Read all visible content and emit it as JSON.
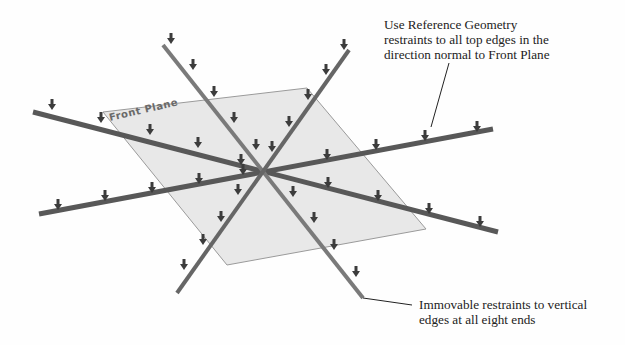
{
  "diagram": {
    "plane": {
      "label": "Front Plane",
      "corners": [
        [
          103,
          112
        ],
        [
          307,
          88
        ],
        [
          426,
          229
        ],
        [
          227,
          265
        ]
      ],
      "fill": "#e8e8e8",
      "stroke": "#9a9a9a"
    },
    "center": [
      263,
      172
    ],
    "beams": [
      {
        "name": "beam-shallow-descending",
        "from": [
          33,
          112
        ],
        "to": [
          498,
          232
        ],
        "color": "#585858",
        "width": 5
      },
      {
        "name": "beam-shallow-ascending",
        "from": [
          39,
          214
        ],
        "to": [
          493,
          129
        ],
        "color": "#585858",
        "width": 5
      },
      {
        "name": "beam-steep-descending",
        "from": [
          163,
          45
        ],
        "to": [
          363,
          298
        ],
        "color": "#7a7a7a",
        "width": 4
      },
      {
        "name": "beam-steep-ascending",
        "from": [
          349,
          50
        ],
        "to": [
          177,
          293
        ],
        "color": "#666666",
        "width": 4
      }
    ],
    "arrow_color": "#3c3c3c",
    "arrows": [
      [
        52,
        110
      ],
      [
        101,
        123
      ],
      [
        150,
        135
      ],
      [
        198,
        148
      ],
      [
        241,
        165
      ],
      [
        328,
        188
      ],
      [
        378,
        201
      ],
      [
        429,
        214
      ],
      [
        480,
        227
      ],
      [
        58,
        210
      ],
      [
        105,
        201
      ],
      [
        152,
        193
      ],
      [
        199,
        184
      ],
      [
        243,
        175
      ],
      [
        327,
        160
      ],
      [
        376,
        150
      ],
      [
        425,
        141
      ],
      [
        477,
        132
      ],
      [
        171,
        44
      ],
      [
        193,
        70
      ],
      [
        214,
        97
      ],
      [
        234,
        123
      ],
      [
        256,
        150
      ],
      [
        293,
        197
      ],
      [
        314,
        223
      ],
      [
        334,
        250
      ],
      [
        356,
        277
      ],
      [
        344,
        50
      ],
      [
        326,
        75
      ],
      [
        308,
        100
      ],
      [
        289,
        127
      ],
      [
        272,
        152
      ],
      [
        238,
        195
      ],
      [
        221,
        222
      ],
      [
        203,
        245
      ],
      [
        184,
        270
      ]
    ],
    "leaders": [
      {
        "from": [
          449,
          63
        ],
        "to": [
          431,
          127
        ]
      },
      {
        "from": [
          363,
          298
        ],
        "to": [
          412,
          305
        ]
      }
    ]
  },
  "callouts": {
    "top": {
      "lines": [
        "Use Reference Geometry",
        "restraints to all top edges in the",
        "direction normal to Front Plane"
      ]
    },
    "bottom": {
      "lines": [
        "Immovable restraints to vertical",
        "edges at all eight ends"
      ]
    }
  }
}
